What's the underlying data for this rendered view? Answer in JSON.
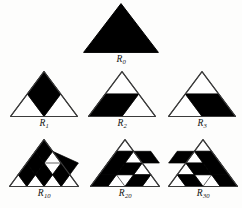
{
  "figure": {
    "background_color": "#fdfdfc",
    "outline_color": "#3c3c3c",
    "fill_color": "#000000",
    "paper_tint": "#ffffff"
  },
  "cells": [
    {
      "name": "R0",
      "label_base": "R",
      "label_sub": "0",
      "order": 1,
      "rhombus_count": 0,
      "orientation": "full",
      "description": "solid black unit triangle"
    },
    {
      "name": "R1",
      "label_base": "R",
      "label_sub": "1",
      "order": 2,
      "rhombus_count": 1,
      "orientation": "vertical",
      "description": "side-2 triangle with one vertical rhombus at center"
    },
    {
      "name": "R2",
      "label_base": "R",
      "label_sub": "2",
      "order": 2,
      "rhombus_count": 1,
      "orientation": "left",
      "description": "side-2 triangle with one left-leaning rhombus"
    },
    {
      "name": "R3",
      "label_base": "R",
      "label_sub": "3",
      "order": 2,
      "rhombus_count": 1,
      "orientation": "right",
      "description": "side-2 triangle with one right-leaning rhombus"
    },
    {
      "name": "R10",
      "label_base": "R",
      "label_sub": "10",
      "order": 4,
      "rhombus_count": 6,
      "orientation": "vertical",
      "description": "side-4 triangle with six vertical rhombi"
    },
    {
      "name": "R20",
      "label_base": "R",
      "label_sub": "20",
      "order": 4,
      "rhombus_count": 6,
      "orientation": "left",
      "description": "side-4 triangle with six left-leaning rhombi"
    },
    {
      "name": "R30",
      "label_base": "R",
      "label_sub": "30",
      "order": 4,
      "rhombus_count": 6,
      "orientation": "right",
      "description": "side-4 triangle with six right-leaning rhombi"
    }
  ]
}
